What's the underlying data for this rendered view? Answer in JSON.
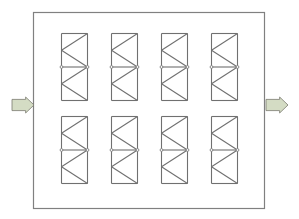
{
  "diagram": {
    "type": "flow-through enclosure with truss modules",
    "colors": {
      "box_stroke": "#808080",
      "truss_stroke": "#707070",
      "arrow_fill": "#d4dcc4",
      "arrow_stroke": "#7a7a6e",
      "background": "#ffffff"
    },
    "enclosure": {
      "x": 33,
      "y": 12,
      "width": 231,
      "height": 196
    },
    "inlet_arrow": {
      "direction": "right",
      "x": 12,
      "y": 97,
      "width": 22,
      "height": 16
    },
    "outlet_arrow": {
      "direction": "right",
      "x": 266,
      "y": 97,
      "width": 22,
      "height": 16
    },
    "modules": [
      {
        "row": 1,
        "col": 1,
        "x": 61,
        "y": 33
      },
      {
        "row": 1,
        "col": 2,
        "x": 111,
        "y": 33
      },
      {
        "row": 1,
        "col": 3,
        "x": 161,
        "y": 33
      },
      {
        "row": 1,
        "col": 4,
        "x": 211,
        "y": 33
      },
      {
        "row": 2,
        "col": 1,
        "x": 61,
        "y": 116
      },
      {
        "row": 2,
        "col": 2,
        "x": 111,
        "y": 116
      },
      {
        "row": 2,
        "col": 3,
        "x": 161,
        "y": 116
      },
      {
        "row": 2,
        "col": 4,
        "x": 211,
        "y": 116
      }
    ],
    "module_size": {
      "width": 26,
      "height": 67
    }
  }
}
